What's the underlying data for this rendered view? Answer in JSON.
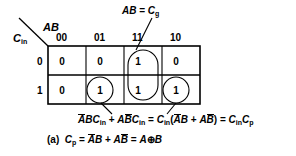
{
  "figure": {
    "caption_tag": "(a)",
    "kmap": {
      "row_var": "C",
      "row_var_sub": "in",
      "col_var": "AB",
      "col_headers": [
        "00",
        "01",
        "11",
        "10"
      ],
      "row_headers": [
        "0",
        "1"
      ],
      "cells": [
        [
          "0",
          "0",
          "1",
          "0"
        ],
        [
          "0",
          "1",
          "1",
          "1"
        ]
      ],
      "groupings": [
        {
          "name": "column-11-pair",
          "shape": "stadium",
          "cells": "11 column, rows 0 and 1"
        },
        {
          "name": "cell-01-row1",
          "shape": "circle",
          "cells": "01 column, row 1"
        },
        {
          "name": "cell-10-row1",
          "shape": "circle",
          "cells": "10 column, row 1"
        }
      ]
    },
    "annotations": {
      "generate": {
        "lhs": "AB",
        "eq": "=",
        "rhs_var": "C",
        "rhs_sub": "g"
      }
    },
    "equations": {
      "propagate_expansion": {
        "term1": {
          "a": "A",
          "a_bar": true,
          "b": "B",
          "b_bar": false,
          "c": "C",
          "c_sub": "in"
        },
        "plus": "+",
        "term2": {
          "a": "A",
          "a_bar": false,
          "b": "B",
          "b_bar": true,
          "c": "C",
          "c_sub": "in"
        },
        "equals1": "=",
        "factored": {
          "c": "C",
          "c_sub": "in",
          "open": "(",
          "t1a": "A",
          "t1b": "B",
          "plus": "+",
          "t2a": "A",
          "t2b": "B",
          "close": ")"
        },
        "equals2": "=",
        "result": {
          "c1": "C",
          "c1_sub": "in",
          "c2": "C",
          "c2_sub": "p"
        }
      },
      "caption": {
        "tag": "(a)",
        "lhs": "C",
        "lhs_sub": "p",
        "eq1": "=",
        "t1a": "A",
        "t1b": "B",
        "plus": "+",
        "t2a": "A",
        "t2b": "B",
        "eq2": "=",
        "xa": "A",
        "xor": "⊕",
        "xb": "B"
      }
    },
    "colors": {
      "line": "#000000",
      "background": "#ffffff"
    }
  }
}
